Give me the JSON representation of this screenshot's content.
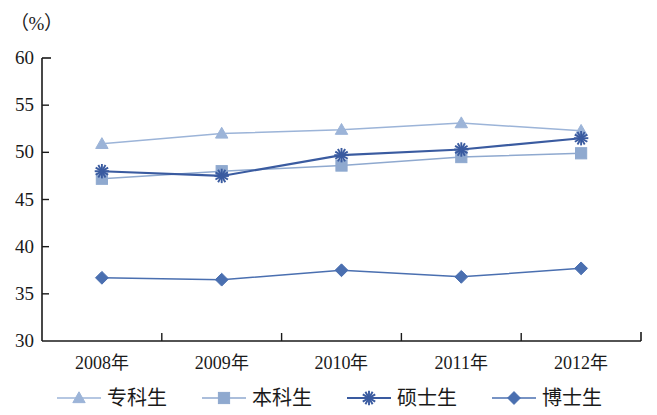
{
  "chart_data": {
    "type": "line",
    "title": "",
    "subtitle": "",
    "xlabel": "",
    "ylabel": "（%）",
    "categories": [
      "2008年",
      "2009年",
      "2010年",
      "2011年",
      "2012年"
    ],
    "ylim": [
      30,
      60
    ],
    "yticks": [
      30,
      35,
      40,
      45,
      50,
      55,
      60
    ],
    "ytick_labels": [
      "30",
      "35",
      "40",
      "45",
      "50",
      "55",
      "60"
    ],
    "grid": false,
    "legend_position": "bottom",
    "series": [
      {
        "name": "专科生",
        "marker": "triangle",
        "color": "#9cb4d8",
        "values": [
          50.9,
          52.0,
          52.4,
          53.1,
          52.3
        ]
      },
      {
        "name": "本科生",
        "marker": "square",
        "color": "#8fa9cf",
        "values": [
          47.2,
          48.0,
          48.6,
          49.5,
          49.9
        ]
      },
      {
        "name": "硕士生",
        "marker": "asterisk",
        "color": "#3a5ba0",
        "values": [
          48.0,
          47.5,
          49.7,
          50.3,
          51.5
        ]
      },
      {
        "name": "博士生",
        "marker": "diamond",
        "color": "#4a6fb0",
        "values": [
          36.7,
          36.5,
          37.5,
          36.8,
          37.7
        ]
      }
    ]
  },
  "axis": {
    "unit_label": "（%）"
  },
  "legend": {
    "items": [
      {
        "label": "专科生"
      },
      {
        "label": "本科生"
      },
      {
        "label": "硕士生"
      },
      {
        "label": "博士生"
      }
    ]
  }
}
